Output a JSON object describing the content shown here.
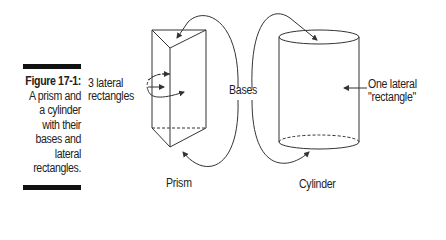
{
  "caption": {
    "label": "Figure 17-1:",
    "lines": [
      "A prism and",
      "a cylinder",
      "with their",
      "bases and",
      "lateral",
      "rectangles."
    ]
  },
  "diagram": {
    "labels": {
      "lateral_prism_1": "3 lateral",
      "lateral_prism_2": "rectangles",
      "bases": "Bases",
      "lateral_cyl_1": "One lateral",
      "lateral_cyl_2": "\"rectangle\"",
      "prism": "Prism",
      "cylinder": "Cylinder"
    },
    "colors": {
      "line": "#333333",
      "bar": "#111111"
    }
  }
}
